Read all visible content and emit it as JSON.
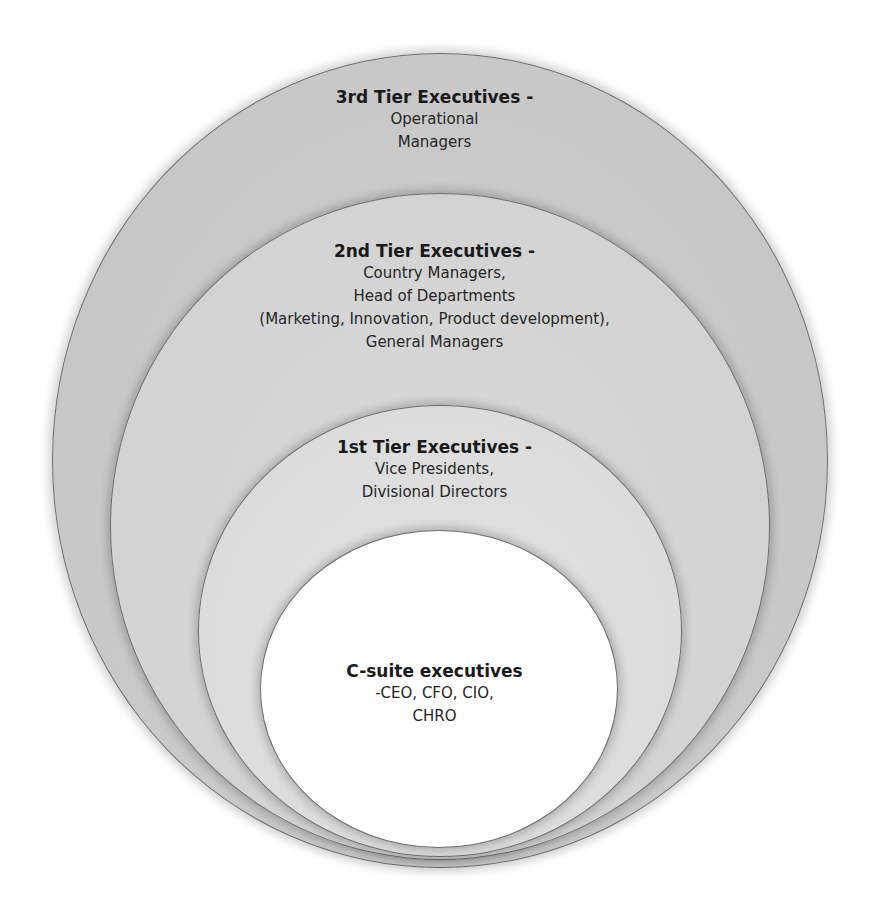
{
  "diagram": {
    "type": "nested-ellipses",
    "colors": {
      "tier3_fill": "#c8c8c8",
      "tier2_fill": "#d4d4d4",
      "tier1_fill": "#dcdcdc",
      "csuite_fill": "#ffffff",
      "outline": "#6e6e6e"
    },
    "tiers": [
      {
        "title": "3rd Tier Executives -",
        "lines": [
          "Operational",
          "Managers"
        ]
      },
      {
        "title": "2nd Tier Executives -",
        "lines": [
          "Country Managers,",
          "Head of Departments",
          "(Marketing, Innovation, Product development),",
          "General Managers"
        ]
      },
      {
        "title": "1st Tier Executives -",
        "lines": [
          "Vice Presidents,",
          "Divisional Directors"
        ]
      },
      {
        "title": "C-suite executives",
        "lines": [
          "-CEO, CFO, CIO,",
          "CHRO"
        ]
      }
    ]
  }
}
